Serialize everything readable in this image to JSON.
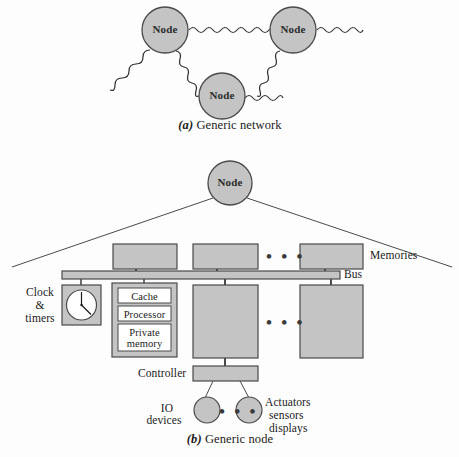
{
  "figure": {
    "colors": {
      "fill_gray": "#c4c4c4",
      "stroke": "#3a3a3a",
      "text": "#1a1a1a",
      "white": "#ffffff",
      "background": "#fdfdfd"
    }
  },
  "panel_a": {
    "caption_marker": "(a)",
    "caption_text": " Generic network",
    "nodes": [
      {
        "id": "node-left",
        "label": "Node",
        "cx": 165,
        "cy": 30,
        "r": 23
      },
      {
        "id": "node-right",
        "label": "Node",
        "cx": 293,
        "cy": 30,
        "r": 23
      },
      {
        "id": "node-bottom",
        "label": "Node",
        "cx": 222,
        "cy": 96,
        "r": 23
      }
    ],
    "links": [
      {
        "from": "node-left",
        "to": "node-right",
        "type": "wavy-internal"
      },
      {
        "from": "node-left",
        "to": "node-bottom",
        "type": "wavy-internal"
      },
      {
        "from": "node-right",
        "to": "node-bottom",
        "type": "wavy-internal"
      },
      {
        "from": "node-left",
        "to": "external",
        "type": "wavy-stub"
      },
      {
        "from": "node-right",
        "to": "external",
        "type": "wavy-stub"
      },
      {
        "from": "node-bottom",
        "to": "external",
        "type": "wavy-stub"
      }
    ]
  },
  "panel_b": {
    "caption_marker": "(b)",
    "caption_text": " Generic node",
    "root_node": {
      "label": "Node",
      "cx": 230,
      "cy": 183,
      "r": 22
    },
    "memories_label": "Memories",
    "bus_label": "Bus",
    "memories_ellipsis": "• • •",
    "modules_ellipsis": "• • •",
    "io_ellipsis": "• • •",
    "clock_label_line1": "Clock",
    "clock_label_line2": "&",
    "clock_label_line3": "timers",
    "processor_boxes": [
      {
        "label": "Cache"
      },
      {
        "label": "Processor"
      },
      {
        "label": "Private\nmemory"
      }
    ],
    "controller_label": "Controller",
    "io_label_line1": "IO",
    "io_label_line2": "devices",
    "actuators_line1": "Actuators",
    "actuators_line2": "sensors",
    "actuators_line3": "displays",
    "memory_boxes": [
      {
        "x": 113,
        "y": 244,
        "w": 64,
        "h": 25
      },
      {
        "x": 193,
        "y": 244,
        "w": 65,
        "h": 25
      },
      {
        "x": 300,
        "y": 244,
        "w": 63,
        "h": 25
      }
    ],
    "bus": {
      "x": 62,
      "y": 271,
      "w": 278,
      "h": 8
    },
    "module_blocks": [
      {
        "x": 193,
        "y": 285,
        "w": 65,
        "h": 73
      },
      {
        "x": 300,
        "y": 285,
        "w": 63,
        "h": 73
      }
    ],
    "clock_box": {
      "x": 62,
      "y": 285,
      "w": 39,
      "h": 40
    },
    "processor_group_box": {
      "x": 112,
      "y": 283,
      "w": 65,
      "h": 74
    },
    "controller_box": {
      "x": 193,
      "y": 366,
      "w": 65,
      "h": 15
    },
    "io_circles": [
      {
        "cx": 208,
        "cy": 410,
        "r": 13
      },
      {
        "cx": 246,
        "cy": 410,
        "r": 13
      }
    ]
  }
}
